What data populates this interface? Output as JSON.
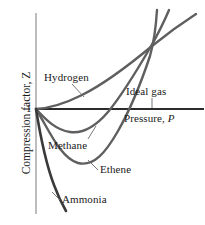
{
  "figure": {
    "title": "",
    "axes": {
      "y_axis_label": "Compression factor, Z",
      "y_axis_symbol": "Z",
      "y_tick_label": "1",
      "x_axis_label": "Pressure, P",
      "x_axis_symbol": "P"
    },
    "curve_labels": {
      "hydrogen": "Hydrogen",
      "ideal_gas": "Ideal gas",
      "methane": "Methane",
      "ethene": "Ethene",
      "ammonia": "Ammonia"
    },
    "colors": {
      "curve": "#5a5a5a",
      "ideal_gas_line": "#2b2b2b",
      "axis": "#8a8a8a",
      "text": "#1a1a1a",
      "leader": "#6a6a6a",
      "background": "#ffffff"
    }
  },
  "chart_data": {
    "type": "line",
    "title": "",
    "subtitle": "",
    "xlabel": "Pressure, P",
    "ylabel": "Compression factor, Z",
    "xlim": [
      0,
      1
    ],
    "ylim": [
      0,
      2.2
    ],
    "grid": false,
    "legend": "inline-annotations",
    "y_ticks": [
      1
    ],
    "y_tick_labels": [
      "1"
    ],
    "x_ticks": [],
    "x_tick_labels": [],
    "annotations": [
      {
        "text": "Hydrogen",
        "x": 0.12,
        "y": 1.38,
        "leader_to": {
          "x": 0.28,
          "y": 1.17
        }
      },
      {
        "text": "Ideal gas",
        "x": 0.68,
        "y": 1.23,
        "leader_to": {
          "x": 0.72,
          "y": 1.0
        }
      },
      {
        "text": "Pressure, P",
        "x": 0.66,
        "y": 0.92
      },
      {
        "text": "Methane",
        "x": 0.17,
        "y": 0.68,
        "leader_to": {
          "x": 0.36,
          "y": 0.8
        }
      },
      {
        "text": "Ethene",
        "x": 0.5,
        "y": 0.44,
        "leader_to": {
          "x": 0.39,
          "y": 0.58
        }
      },
      {
        "text": "Ammonia",
        "x": 0.25,
        "y": 0.12,
        "leader_to": {
          "x": 0.17,
          "y": 0.2
        }
      }
    ],
    "series": [
      {
        "name": "Ideal gas",
        "style": "straight-horizontal",
        "color": "#2b2b2b",
        "x": [
          0.0,
          1.0
        ],
        "values": [
          1.0,
          1.0
        ]
      },
      {
        "name": "Hydrogen",
        "style": "monotonic-rise",
        "color": "#5a5a5a",
        "x": [
          0.0,
          0.12,
          0.25,
          0.4,
          0.55,
          0.7,
          0.85,
          1.0
        ],
        "values": [
          1.0,
          1.06,
          1.14,
          1.26,
          1.38,
          1.5,
          1.62,
          1.74
        ]
      },
      {
        "name": "Methane",
        "style": "shallow-minimum",
        "color": "#5a5a5a",
        "x": [
          0.0,
          0.1,
          0.22,
          0.35,
          0.5,
          0.65,
          0.78,
          0.92
        ],
        "values": [
          1.0,
          0.88,
          0.8,
          0.8,
          0.9,
          1.12,
          1.46,
          1.9
        ]
      },
      {
        "name": "Ethene",
        "style": "deep-minimum",
        "color": "#5a5a5a",
        "x": [
          0.0,
          0.1,
          0.22,
          0.32,
          0.45,
          0.58,
          0.7,
          0.85
        ],
        "values": [
          1.0,
          0.76,
          0.6,
          0.58,
          0.7,
          0.98,
          1.36,
          1.96
        ]
      },
      {
        "name": "Ammonia",
        "style": "steep-decline",
        "color": "#2b2b2b",
        "x": [
          0.0,
          0.05,
          0.1,
          0.15,
          0.2
        ],
        "values": [
          1.0,
          0.72,
          0.46,
          0.24,
          0.06
        ]
      }
    ]
  }
}
